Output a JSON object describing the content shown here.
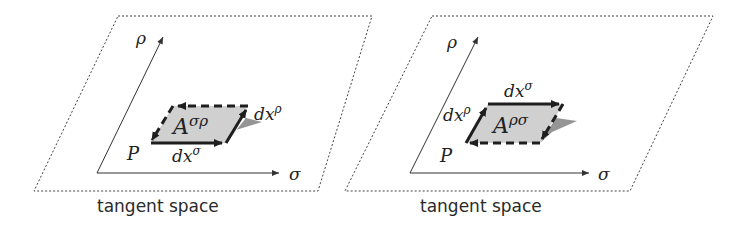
{
  "panels": [
    {
      "id": "left",
      "caption": "tangent space",
      "axis_vertical_label": "ρ",
      "axis_horizontal_label": "σ",
      "point_label": "P",
      "area_label_base": "A",
      "area_label_sup": "σρ",
      "edge_bottom_label_base": "dx",
      "edge_bottom_label_sup": "σ",
      "edge_right_label_base": "dx",
      "edge_right_label_sup": "ρ"
    },
    {
      "id": "right",
      "caption": "tangent space",
      "axis_vertical_label": "ρ",
      "axis_horizontal_label": "σ",
      "point_label": "P",
      "area_label_base": "A",
      "area_label_sup": "ρσ",
      "edge_top_label_base": "dx",
      "edge_top_label_sup": "σ",
      "edge_left_label_base": "dx",
      "edge_left_label_sup": "ρ"
    }
  ],
  "colors": {
    "fill": "#d0d0d0",
    "shadow": "#8a8a8a",
    "stroke": "#1e1e1e",
    "dotted": "#444444"
  }
}
